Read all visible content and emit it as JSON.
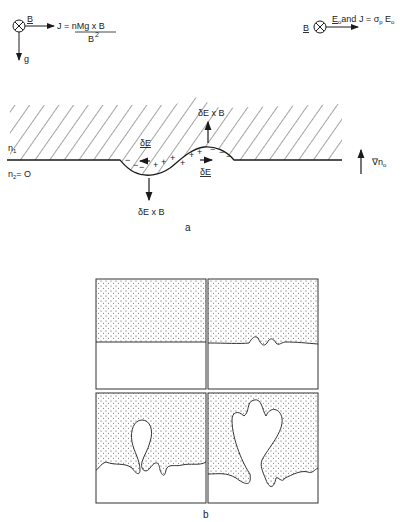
{
  "figure": {
    "part_a": {
      "caption": "a",
      "legend_left": {
        "b_symbol": "B",
        "current_formula_lhs": "J = nMg x B",
        "current_formula_den": "B",
        "current_formula_exp": "2",
        "gravity_label": "g"
      },
      "legend_right": {
        "b_symbol": "B",
        "text": "E",
        "text_sub": "o",
        "text_rest": "and  J = σ",
        "sigma_sub": "p",
        "e2": "E",
        "e2_sub": "o"
      },
      "region_upper_label": "n",
      "region_upper_sub": "1",
      "region_lower_label": "n",
      "region_lower_sub": "2",
      "region_lower_value": "= O",
      "gradient_label": "∇n",
      "gradient_sub": "o",
      "perturbation_labels": {
        "dE_left": "δE",
        "dE_right": "δE",
        "drift_up": "δE x B",
        "drift_down": "δE x B"
      }
    },
    "part_b": {
      "caption": "b",
      "panels": [
        "initial flat interface",
        "small ripples",
        "rising bubble",
        "bifurcated bubble"
      ]
    }
  }
}
